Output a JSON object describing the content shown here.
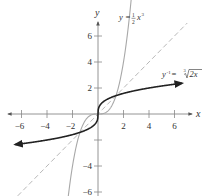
{
  "chart_data": {
    "type": "line",
    "title": "",
    "xlabel": "x",
    "ylabel": "y",
    "xlim": [
      -6.8,
      7
    ],
    "ylim": [
      -6.3,
      7
    ],
    "grid": false,
    "legend": "inline labels",
    "x_ticks": [
      -6,
      -4,
      -2,
      2,
      4,
      6
    ],
    "x_tick_labels": [
      "-6",
      "-4",
      "-2",
      "2",
      "4",
      "6"
    ],
    "y_ticks": [
      -6,
      -4,
      -2,
      2,
      4,
      6
    ],
    "y_tick_labels": [
      "-6",
      "-4",
      "",
      "2",
      "4",
      "6"
    ],
    "series": [
      {
        "name": "y = ½x³",
        "label_main": "y = ",
        "label_frac_num": "1",
        "label_frac_den": "2",
        "label_tail": "x",
        "label_exp": "3",
        "function": "0.5*x^3",
        "x_range": [
          -2.9,
          2.9
        ],
        "color": "#a8a8a8",
        "style": "solid",
        "arrows": "both"
      },
      {
        "name": "y⁻¹ = ∛(2x)",
        "label_main": "y",
        "label_exp": "-1",
        "label_eq": " = ",
        "label_root_index": "3",
        "label_radicand": "2x",
        "function": "cbrt(2*x)",
        "x_range": [
          -6.5,
          6.6
        ],
        "color": "#222222",
        "style": "solid",
        "arrows": "both"
      },
      {
        "name": "y = x",
        "function": "x",
        "x_range": [
          -6.3,
          7
        ],
        "color": "#b0b0b0",
        "style": "dashed",
        "arrows": "none"
      }
    ],
    "intersections": [
      [
        -1.414,
        -1.414
      ],
      [
        0,
        0
      ],
      [
        1.414,
        1.414
      ]
    ]
  },
  "layout": {
    "origin_px": [
      98,
      114
    ],
    "px_per_unit_x": 12.75,
    "px_per_unit_y": 13
  }
}
